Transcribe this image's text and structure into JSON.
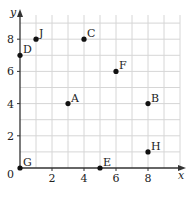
{
  "chart_data": {
    "type": "scatter",
    "title": "",
    "xlabel": "x",
    "ylabel": "y",
    "xlim": [
      0,
      10
    ],
    "ylim": [
      0,
      9.5
    ],
    "grid": true,
    "x_ticks": [
      0,
      2,
      4,
      6,
      8
    ],
    "y_ticks": [
      2,
      4,
      6,
      8
    ],
    "origin_label": "0",
    "points": [
      {
        "label": "A",
        "x": 3,
        "y": 4
      },
      {
        "label": "B",
        "x": 8,
        "y": 4
      },
      {
        "label": "C",
        "x": 4,
        "y": 8
      },
      {
        "label": "D",
        "x": 0,
        "y": 7
      },
      {
        "label": "E",
        "x": 5,
        "y": 0
      },
      {
        "label": "F",
        "x": 6,
        "y": 6
      },
      {
        "label": "G",
        "x": 0,
        "y": 0
      },
      {
        "label": "H",
        "x": 8,
        "y": 1
      },
      {
        "label": "J",
        "x": 1,
        "y": 8
      }
    ]
  },
  "colors": {
    "grid": "#d6d6d6",
    "axis": "#333333",
    "point": "#111111"
  }
}
